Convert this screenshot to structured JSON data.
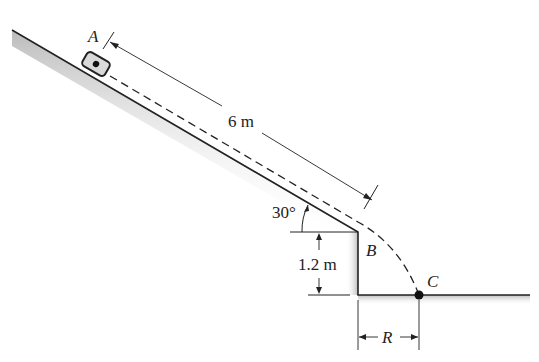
{
  "figure": {
    "labels": {
      "point_a": "A",
      "point_b": "B",
      "point_c": "C",
      "slope_length": "6 m",
      "angle": "30°",
      "height": "1.2 m",
      "range": "R"
    },
    "colors": {
      "line": "#222222",
      "shade": "#b8b8b8",
      "block_fill": "#d9d9d9"
    }
  }
}
